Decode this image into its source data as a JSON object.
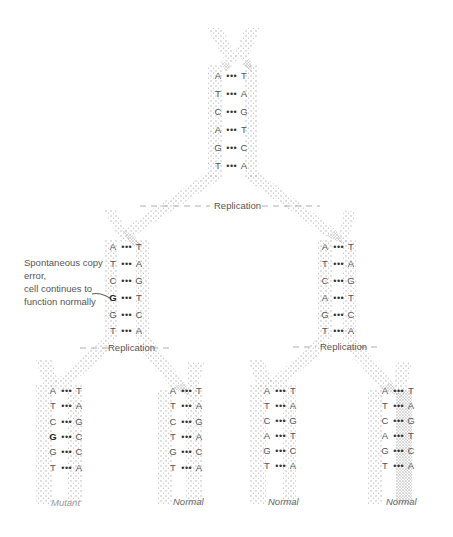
{
  "annotation": {
    "line1": "Spontaneous copy",
    "line2": "error,",
    "line3": "cell continues to",
    "line4": "function normally"
  },
  "replication_labels": {
    "first": "Replication",
    "left": "Replication",
    "right": "Replication"
  },
  "strands": {
    "parent": {
      "pairs": [
        [
          "A",
          "T"
        ],
        [
          "T",
          "A"
        ],
        [
          "C",
          "G"
        ],
        [
          "A",
          "T"
        ],
        [
          "G",
          "C"
        ],
        [
          "T",
          "A"
        ]
      ]
    },
    "gen1_left": {
      "pairs": [
        [
          "A",
          "T"
        ],
        [
          "T",
          "A"
        ],
        [
          "C",
          "G"
        ],
        [
          "G",
          "T"
        ],
        [
          "G",
          "C"
        ],
        [
          "T",
          "A"
        ]
      ],
      "error_row": 3
    },
    "gen1_right": {
      "pairs": [
        [
          "A",
          "T"
        ],
        [
          "T",
          "A"
        ],
        [
          "C",
          "G"
        ],
        [
          "A",
          "T"
        ],
        [
          "G",
          "C"
        ],
        [
          "T",
          "A"
        ]
      ]
    },
    "gen2_1": {
      "pairs": [
        [
          "A",
          "T"
        ],
        [
          "T",
          "A"
        ],
        [
          "C",
          "G"
        ],
        [
          "G",
          "C"
        ],
        [
          "G",
          "C"
        ],
        [
          "T",
          "A"
        ]
      ],
      "mutant_row": 3
    },
    "gen2_2": {
      "pairs": [
        [
          "A",
          "T"
        ],
        [
          "T",
          "A"
        ],
        [
          "C",
          "G"
        ],
        [
          "T",
          "A"
        ],
        [
          "G",
          "C"
        ],
        [
          "T",
          "A"
        ]
      ]
    },
    "gen2_3": {
      "pairs": [
        [
          "A",
          "T"
        ],
        [
          "T",
          "A"
        ],
        [
          "C",
          "G"
        ],
        [
          "A",
          "T"
        ],
        [
          "G",
          "C"
        ],
        [
          "T",
          "A"
        ]
      ]
    },
    "gen2_4": {
      "pairs": [
        [
          "A",
          "T"
        ],
        [
          "T",
          "A"
        ],
        [
          "C",
          "G"
        ],
        [
          "A",
          "T"
        ],
        [
          "G",
          "C"
        ],
        [
          "T",
          "A"
        ]
      ]
    }
  },
  "outcomes": {
    "o1": "Mutant",
    "o2": "Normal",
    "o3": "Normal",
    "o4": "Normal"
  },
  "bond": "• • •",
  "colors": {
    "strand_stipple": "#b8b8b8",
    "text": "#555555",
    "mutant_label": "#999999"
  }
}
